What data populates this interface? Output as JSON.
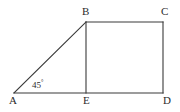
{
  "figure": {
    "background_color": "#ffffff",
    "stroke_color": "#3a3a3a",
    "stroke_width": 1,
    "label_color": "#2b2b2b",
    "vertices": {
      "A": {
        "label": "A",
        "x": 14,
        "y": 93
      },
      "B": {
        "label": "B",
        "x": 86,
        "y": 22
      },
      "C": {
        "label": "C",
        "x": 163,
        "y": 22
      },
      "D": {
        "label": "D",
        "x": 163,
        "y": 93
      },
      "E": {
        "label": "E",
        "x": 86,
        "y": 93
      }
    },
    "segments": [
      {
        "name": "AB",
        "from": "A",
        "to": "B"
      },
      {
        "name": "BC",
        "from": "B",
        "to": "C"
      },
      {
        "name": "CD",
        "from": "C",
        "to": "D"
      },
      {
        "name": "AD",
        "from": "A",
        "to": "D"
      },
      {
        "name": "BE",
        "from": "B",
        "to": "E"
      }
    ],
    "angles": [
      {
        "name": "angle-at-A",
        "vertex": "A",
        "value": "45",
        "unit": "°",
        "text": "45"
      }
    ]
  }
}
